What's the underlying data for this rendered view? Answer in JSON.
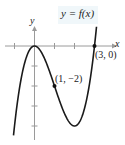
{
  "chart_data": {
    "type": "line",
    "title": "y = f(x)",
    "xlabel": "x",
    "ylabel": "y",
    "function": "f(x) = x^3 - 3x^2",
    "xlim": [
      -1.7,
      3.6
    ],
    "ylim": [
      -4.5,
      1.5
    ],
    "x_ticks": [
      -1,
      0,
      1,
      2,
      3
    ],
    "y_ticks": [
      -1,
      -2,
      -3,
      -4
    ],
    "grid": false,
    "series": [
      {
        "name": "f(x)",
        "x": [
          -1.05,
          -1,
          -0.5,
          0,
          0.5,
          1,
          1.5,
          2,
          2.5,
          3,
          3.1
        ],
        "values": [
          -4.46,
          -4,
          -0.875,
          0,
          -0.625,
          -2,
          -3.375,
          -4,
          -3.125,
          0,
          0.96
        ]
      }
    ],
    "annotations": [
      {
        "label": "(1, −2)",
        "x": 1,
        "y": -2
      },
      {
        "label": "(3, 0)",
        "x": 3,
        "y": 0
      }
    ]
  },
  "labels": {
    "title": "y = f(x)",
    "x_axis": "x",
    "y_axis": "y",
    "point1": "(1, −2)",
    "point2": "(3, 0)"
  },
  "colors": {
    "curve": "#1a1a1a",
    "axis": "#9a9a9a",
    "title_bg": "#f0f7fa"
  }
}
